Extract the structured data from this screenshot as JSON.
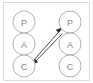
{
  "diagram": {
    "background_color": "#ffffff",
    "frame_color": "#dcdcdc",
    "node_stroke_color": "#b3b3b3",
    "node_fill_color": "#ffffff",
    "label_color": "#8a8a8a",
    "arrow_color": "#2b2b2b",
    "columns": [
      {
        "name": "left-agent",
        "nodes": [
          {
            "id": "left-p",
            "label": "P",
            "cx": 24,
            "cy": 22,
            "r": 11
          },
          {
            "id": "left-a",
            "label": "A",
            "cx": 24,
            "cy": 44,
            "r": 11
          },
          {
            "id": "left-c",
            "label": "C",
            "cx": 24,
            "cy": 66,
            "r": 11
          }
        ]
      },
      {
        "name": "right-agent",
        "nodes": [
          {
            "id": "right-p",
            "label": "P",
            "cx": 70,
            "cy": 22,
            "r": 11
          },
          {
            "id": "right-a",
            "label": "A",
            "cx": 70,
            "cy": 44,
            "r": 11
          },
          {
            "id": "right-c",
            "label": "C",
            "cx": 70,
            "cy": 66,
            "r": 11
          }
        ]
      }
    ],
    "connections": [
      {
        "id": "control-up",
        "from": "left-c",
        "to": "right-p",
        "direction": "up-right",
        "arrowhead_at": "right-p"
      },
      {
        "id": "control-down",
        "from": "right-p",
        "to": "left-c",
        "direction": "down-left",
        "arrowhead_at": "left-c"
      }
    ]
  }
}
